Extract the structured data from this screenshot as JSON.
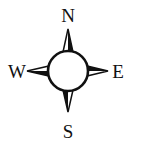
{
  "compass": {
    "labels": {
      "north": "N",
      "south": "S",
      "east": "E",
      "west": "W"
    },
    "colors": {
      "ink": "#111111",
      "fill": "#ffffff"
    }
  }
}
